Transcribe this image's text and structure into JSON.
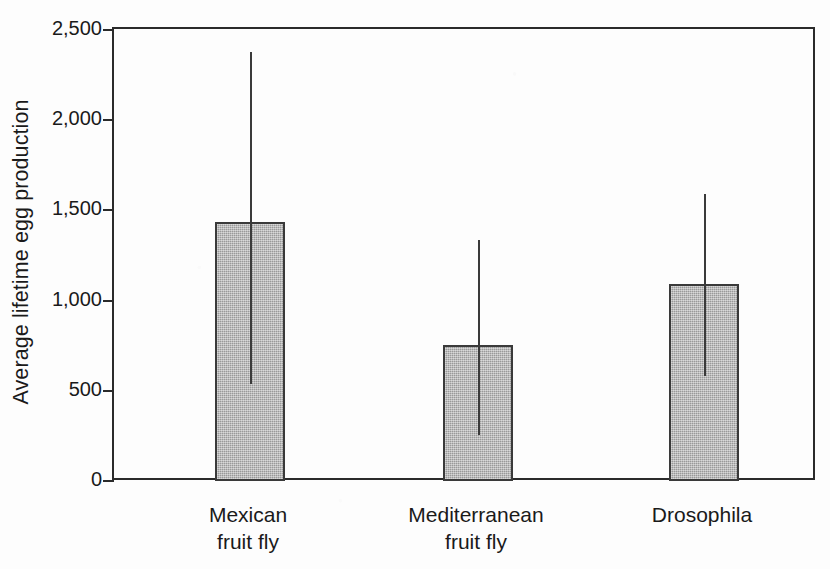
{
  "chart_data": {
    "type": "bar",
    "title": "",
    "subtitle": "",
    "xlabel": "",
    "ylabel": "Average lifetime egg production",
    "categories": [
      "Mexican\nfruit fly",
      "Mediterranean\nfruit fly",
      "Drosophila"
    ],
    "category_labels_flat": [
      "Mexican fruit fly",
      "Mediterranean fruit fly",
      "Drosophila"
    ],
    "values": [
      1435,
      755,
      1090
    ],
    "error_high": [
      2380,
      1335,
      1590
    ],
    "error_low": [
      540,
      255,
      580
    ],
    "error_bar_style": "range-line-no-caps",
    "ylim": [
      0,
      2500
    ],
    "ytick_values": [
      0,
      500,
      1000,
      1500,
      2000,
      2500
    ],
    "ytick_labels": [
      "0",
      "500",
      "1,000",
      "1,500",
      "2,000",
      "2,500"
    ],
    "grid": false,
    "legend": null,
    "legend_position": "none",
    "series": [
      {
        "name": "Average lifetime egg production",
        "values": [
          1435,
          755,
          1090
        ]
      }
    ],
    "bar_fill_color": "#ababab",
    "bar_edge_color": "#3a3a3a",
    "axis_color": "#2b2b2b",
    "background_color": "#fdfdfd"
  },
  "axes": {
    "y_title": "Average lifetime egg production"
  }
}
